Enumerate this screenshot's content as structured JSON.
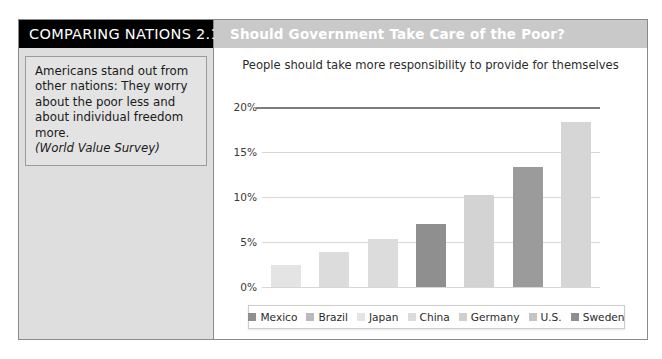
{
  "figure": {
    "badge_label": "COMPARING NATIONS 2.1",
    "title_bar": "Should Government Take Care of the Poor?",
    "note": {
      "body": "Americans stand out from other nations: They worry about the poor less and about individual freedom more.",
      "source": "(World Value Survey)"
    }
  },
  "chart_data": {
    "type": "bar",
    "title": "People should take more responsibility to provide for themselves",
    "xlabel": "",
    "ylabel": "",
    "ylim": [
      0,
      20
    ],
    "ytick_labels": [
      "20%",
      "15%",
      "10%",
      "5%",
      "0%"
    ],
    "ytick_values": [
      20,
      15,
      10,
      5,
      0
    ],
    "grid": true,
    "legend_position": "bottom",
    "categories": [
      "Mexico",
      "Brazil",
      "Japan",
      "China",
      "Germany",
      "U.S.",
      "Sweden"
    ],
    "values": [
      2.4,
      3.9,
      5.3,
      7.0,
      10.2,
      13.3,
      18.3
    ],
    "value_unit": "%",
    "colors": [
      "#e4e4e4",
      "#dcdcdc",
      "#dcdcdc",
      "#8f8f8f",
      "#d3d3d3",
      "#9b9b9b",
      "#d6d6d6"
    ],
    "legend": [
      {
        "label": "Mexico",
        "color": "#8f8f8f"
      },
      {
        "label": "Brazil",
        "color": "#b9b9b9"
      },
      {
        "label": "Japan",
        "color": "#e4e4e4"
      },
      {
        "label": "China",
        "color": "#dcdcdc"
      },
      {
        "label": "Germany",
        "color": "#cfcfcf"
      },
      {
        "label": "U.S.",
        "color": "#c4c4c4"
      },
      {
        "label": "Sweden",
        "color": "#8f8f8f"
      }
    ]
  }
}
